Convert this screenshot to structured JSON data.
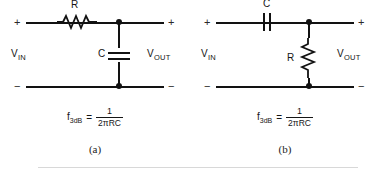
{
  "figure": {
    "panels": [
      {
        "caption": "(a)",
        "filter_type": "low-pass",
        "series_component": {
          "type": "resistor",
          "label": "R",
          "orientation": "horizontal",
          "position": "series-top-rail"
        },
        "shunt_component": {
          "type": "capacitor",
          "label": "C",
          "orientation": "vertical",
          "position": "shunt-to-bottom-rail"
        },
        "input_port": {
          "label": "V",
          "subscript": "IN",
          "plus": "+",
          "minus": "−"
        },
        "output_port": {
          "label": "V",
          "subscript": "OUT",
          "plus": "+",
          "minus": "−"
        },
        "formula": {
          "lhs_symbol": "f",
          "lhs_subscript": "3dB",
          "equals": "=",
          "numerator": "1",
          "denominator": "2πRC"
        }
      },
      {
        "caption": "(b)",
        "filter_type": "high-pass",
        "series_component": {
          "type": "capacitor",
          "label": "C",
          "orientation": "horizontal",
          "position": "series-top-rail"
        },
        "shunt_component": {
          "type": "resistor",
          "label": "R",
          "orientation": "vertical",
          "position": "shunt-to-bottom-rail"
        },
        "input_port": {
          "label": "V",
          "subscript": "IN",
          "plus": "+",
          "minus": "−"
        },
        "output_port": {
          "label": "V",
          "subscript": "OUT",
          "plus": "+",
          "minus": "−"
        },
        "formula": {
          "lhs_symbol": "f",
          "lhs_subscript": "3dB",
          "equals": "=",
          "numerator": "1",
          "denominator": "2πRC"
        }
      }
    ],
    "colors": {
      "wire": "#121212",
      "text": "#151515",
      "background": "#ffffff",
      "divider": "#d8d8d8"
    }
  }
}
